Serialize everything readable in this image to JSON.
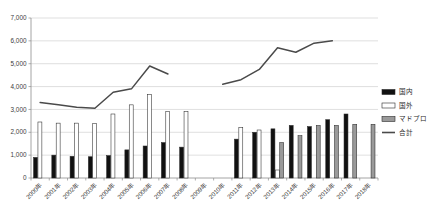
{
  "chart_data": {
    "type": "bar",
    "title": "",
    "xlabel": "",
    "ylabel": "",
    "ylim": [
      0,
      7000
    ],
    "ytick_step": 1000,
    "grid": true,
    "legend_position": "right",
    "categories": [
      "2000年",
      "2001年",
      "2002年",
      "2003年",
      "2004年",
      "2005年",
      "2006年",
      "2007年",
      "2008年",
      "2009年",
      "2010年",
      "2011年",
      "2012年",
      "2013年",
      "2014年",
      "2015年",
      "2016年",
      "2017年",
      "2018年"
    ],
    "ytick_labels": [
      "0",
      "1,000",
      "2,000",
      "3,000",
      "4,000",
      "5,000",
      "6,000",
      "7,000"
    ],
    "series": [
      {
        "name": "国内",
        "color": "#111111",
        "kind": "bar",
        "values": [
          900,
          1000,
          950,
          930,
          980,
          1230,
          1400,
          1550,
          1350,
          null,
          null,
          1700,
          2000,
          2150,
          2300,
          2250,
          2550,
          2800,
          null
        ]
      },
      {
        "name": "国外",
        "color": "#ffffff",
        "kind": "bar",
        "values": [
          2450,
          2400,
          2400,
          2380,
          2800,
          3200,
          3650,
          2900,
          2900,
          null,
          null,
          2200,
          2100,
          350,
          null,
          null,
          null,
          null,
          null
        ]
      },
      {
        "name": "マドプロ",
        "color": "#9a9a9a",
        "kind": "bar",
        "values": [
          null,
          null,
          null,
          null,
          null,
          null,
          null,
          null,
          null,
          null,
          null,
          null,
          null,
          1550,
          1850,
          2300,
          2300,
          2350,
          2350
        ]
      },
      {
        "name": "合計",
        "color": "#4a4a4a",
        "kind": "line",
        "values": [
          3300,
          3200,
          3100,
          3050,
          3750,
          3900,
          4900,
          4550,
          null,
          null,
          4100,
          4300,
          4750,
          5700,
          5500,
          5900,
          6000,
          null,
          null
        ]
      }
    ]
  },
  "legend": {
    "items": [
      {
        "label": "国内",
        "swatch": "solid-black"
      },
      {
        "label": "国外",
        "swatch": "outlined-white"
      },
      {
        "label": "マドプロ",
        "swatch": "solid-gray"
      },
      {
        "label": "合計",
        "swatch": "line"
      }
    ]
  }
}
